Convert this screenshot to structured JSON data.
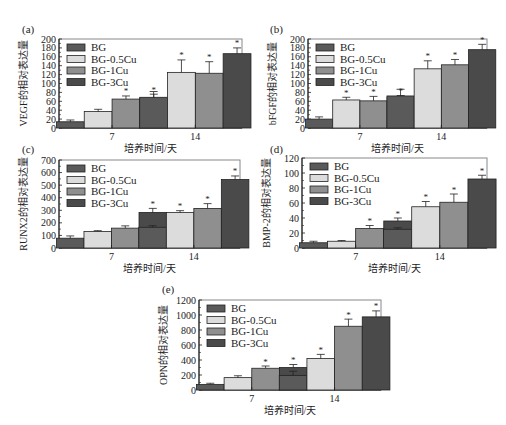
{
  "legend": [
    "BG",
    "BG-0.5Cu",
    "BG-1Cu",
    "BG-3Cu"
  ],
  "colors": {
    "BG": "#5a5a5a",
    "BG-0.5Cu": "#dcdcdc",
    "BG-1Cu": "#8f8f8f",
    "BG-3Cu": "#4a4a4a",
    "frame": "#888888",
    "bar_stroke": "#222222"
  },
  "chart_data": [
    {
      "panel": "(a)",
      "type": "bar",
      "title": "",
      "xlabel": "培养时间/天",
      "ylabel": "VEGF的相对表达量",
      "categories": [
        "7",
        "14"
      ],
      "ylim": [
        0,
        200
      ],
      "yticks": [
        0,
        20,
        40,
        60,
        80,
        100,
        120,
        140,
        160,
        180,
        200
      ],
      "legend_position": "upper-left",
      "grid": false,
      "series": [
        {
          "name": "BG",
          "values": [
            14,
            69
          ],
          "errors": [
            4,
            13
          ],
          "significant": [
            false,
            false
          ]
        },
        {
          "name": "BG-0.5Cu",
          "values": [
            37,
            125
          ],
          "errors": [
            5,
            28
          ],
          "significant": [
            false,
            true
          ]
        },
        {
          "name": "BG-1Cu",
          "values": [
            65,
            123
          ],
          "errors": [
            7,
            26
          ],
          "significant": [
            true,
            true
          ]
        },
        {
          "name": "BG-3Cu",
          "values": [
            67,
            167
          ],
          "errors": [
            9,
            13
          ],
          "significant": [
            true,
            true
          ]
        }
      ]
    },
    {
      "panel": "(b)",
      "type": "bar",
      "title": "",
      "xlabel": "培养时间/天",
      "ylabel": "bFGF的相对表达量",
      "categories": [
        "7",
        "14"
      ],
      "ylim": [
        0,
        200
      ],
      "yticks": [
        0,
        20,
        40,
        60,
        80,
        100,
        120,
        140,
        160,
        180,
        200
      ],
      "legend_position": "upper-left",
      "grid": false,
      "series": [
        {
          "name": "BG",
          "values": [
            20,
            72
          ],
          "errors": [
            5,
            15
          ],
          "significant": [
            false,
            false
          ]
        },
        {
          "name": "BG-0.5Cu",
          "values": [
            63,
            133
          ],
          "errors": [
            6,
            18
          ],
          "significant": [
            true,
            true
          ]
        },
        {
          "name": "BG-1Cu",
          "values": [
            61,
            142
          ],
          "errors": [
            10,
            12
          ],
          "significant": [
            true,
            true
          ]
        },
        {
          "name": "BG-3Cu",
          "values": [
            69,
            176
          ],
          "errors": [
            4,
            12
          ],
          "significant": [
            true,
            true
          ]
        }
      ]
    },
    {
      "panel": "(c)",
      "type": "bar",
      "title": "",
      "xlabel": "培养时间/天",
      "ylabel": "RUNX2的相对表达量",
      "categories": [
        "7",
        "14"
      ],
      "ylim": [
        0,
        700
      ],
      "yticks": [
        0,
        100,
        200,
        300,
        400,
        500,
        600,
        700
      ],
      "legend_position": "upper-left",
      "grid": false,
      "series": [
        {
          "name": "BG",
          "values": [
            78,
            165
          ],
          "errors": [
            18,
            12
          ],
          "significant": [
            false,
            false
          ]
        },
        {
          "name": "BG-0.5Cu",
          "values": [
            132,
            282
          ],
          "errors": [
            6,
            15
          ],
          "significant": [
            false,
            true
          ]
        },
        {
          "name": "BG-1Cu",
          "values": [
            158,
            315
          ],
          "errors": [
            18,
            38
          ],
          "significant": [
            false,
            true
          ]
        },
        {
          "name": "BG-3Cu",
          "values": [
            283,
            545
          ],
          "errors": [
            32,
            28
          ],
          "significant": [
            true,
            true
          ]
        }
      ]
    },
    {
      "panel": "(d)",
      "type": "bar",
      "title": "",
      "xlabel": "培养时间/天",
      "ylabel": "BMP-2的相对表达量",
      "categories": [
        "7",
        "14"
      ],
      "ylim": [
        0,
        120
      ],
      "yticks": [
        0,
        20,
        40,
        60,
        80,
        100,
        120
      ],
      "legend_position": "upper-left",
      "grid": false,
      "series": [
        {
          "name": "BG",
          "values": [
            7,
            25
          ],
          "errors": [
            2,
            2
          ],
          "significant": [
            false,
            false
          ]
        },
        {
          "name": "BG-0.5Cu",
          "values": [
            9,
            55
          ],
          "errors": [
            1,
            7
          ],
          "significant": [
            false,
            true
          ]
        },
        {
          "name": "BG-1Cu",
          "values": [
            26,
            61
          ],
          "errors": [
            4,
            11
          ],
          "significant": [
            true,
            true
          ]
        },
        {
          "name": "BG-3Cu",
          "values": [
            36,
            92
          ],
          "errors": [
            4,
            5
          ],
          "significant": [
            true,
            true
          ]
        }
      ]
    },
    {
      "panel": "(e)",
      "type": "bar",
      "title": "",
      "xlabel": "培养时间/天",
      "ylabel": "OPN的相对表达量",
      "categories": [
        "7",
        "14"
      ],
      "ylim": [
        0,
        1200
      ],
      "yticks": [
        0,
        200,
        400,
        600,
        800,
        1000,
        1200
      ],
      "legend_position": "upper-left",
      "grid": false,
      "series": [
        {
          "name": "BG",
          "values": [
            75,
            195
          ],
          "errors": [
            15,
            55
          ],
          "significant": [
            false,
            false
          ]
        },
        {
          "name": "BG-0.5Cu",
          "values": [
            165,
            420
          ],
          "errors": [
            25,
            55
          ],
          "significant": [
            false,
            true
          ]
        },
        {
          "name": "BG-1Cu",
          "values": [
            290,
            850
          ],
          "errors": [
            30,
            95
          ],
          "significant": [
            true,
            true
          ]
        },
        {
          "name": "BG-3Cu",
          "values": [
            300,
            975
          ],
          "errors": [
            40,
            80
          ],
          "significant": [
            true,
            true
          ]
        }
      ]
    }
  ],
  "layout": [
    {
      "left": 59,
      "right": 242,
      "top": 39,
      "bottom": 128,
      "label_x": 22,
      "label_y": 33
    },
    {
      "left": 308,
      "right": 487,
      "top": 39,
      "bottom": 128,
      "label_x": 270,
      "label_y": 33
    },
    {
      "left": 59,
      "right": 240,
      "top": 160,
      "bottom": 248,
      "label_x": 22,
      "label_y": 153
    },
    {
      "left": 302,
      "right": 487,
      "top": 158,
      "bottom": 248,
      "label_x": 270,
      "label_y": 153
    },
    {
      "left": 199,
      "right": 381,
      "top": 300,
      "bottom": 390,
      "label_x": 162,
      "label_y": 293
    }
  ]
}
